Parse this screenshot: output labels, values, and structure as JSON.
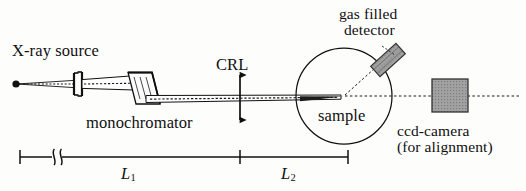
{
  "figure": {
    "kind": "x-ray-scattering-setup-schematic",
    "background_color": "#fdfdfc",
    "ink_color": "#101010",
    "fill_gray": "#9a9a9a"
  },
  "labels": {
    "xray_source": "X-ray source",
    "monochromator": "monochromator",
    "crl": "CRL",
    "gas_detector_line1": "gas filled",
    "gas_detector_line2": "detector",
    "sample": "sample",
    "ccd_line1": "ccd-camera",
    "ccd_line2": "(for alignment)",
    "length_1": "L",
    "length_1_sub": "1",
    "length_2": "L",
    "length_2_sub": "2"
  },
  "components": {
    "source_point": {
      "name": "x-ray-source-point",
      "x": 16,
      "y": 84
    },
    "slit": {
      "name": "entrance-slit",
      "x": 78,
      "y": 84
    },
    "monochromator_crystal": {
      "name": "monochromator-crystal",
      "x": 143,
      "y": 92
    },
    "crl_lens": {
      "name": "compound-refractive-lens",
      "x": 240,
      "y": 97
    },
    "sample_circle": {
      "name": "sample-goniometer-circle",
      "cx": 344,
      "cy": 96,
      "r": 48
    },
    "gas_detector": {
      "name": "gas-filled-detector",
      "x": 388,
      "y": 60,
      "angle_deg": -45
    },
    "ccd_camera": {
      "name": "ccd-camera",
      "x": 455,
      "y": 96
    }
  },
  "dimension_line": {
    "name": "distance-scale",
    "y": 157,
    "left_tick_x": 20,
    "break_x": 55,
    "middle_tick_x": 240,
    "right_tick_x": 348,
    "has_break_symbol": true
  }
}
